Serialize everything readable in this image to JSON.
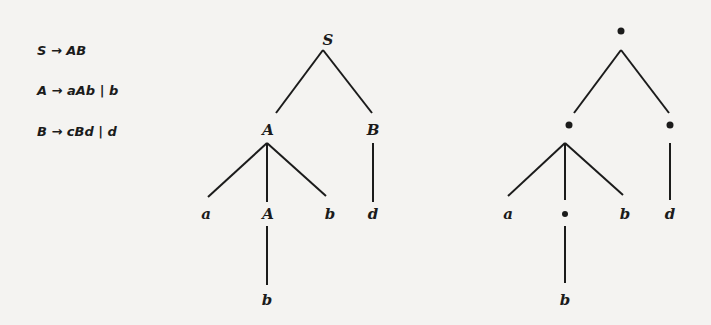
{
  "grammar": {
    "rules": [
      {
        "lhs": "S",
        "arrow": "→",
        "rhs": "AB",
        "text": "S → AB"
      },
      {
        "lhs": "A",
        "arrow": "→",
        "rhs": "aAb | b",
        "text": "A → aAb | b"
      },
      {
        "lhs": "B",
        "arrow": "→",
        "rhs": "cBd | d",
        "text": "B → cBd | d"
      }
    ]
  },
  "parse_tree": {
    "nodes": {
      "root": "S",
      "left_child": "A",
      "right_child": "B",
      "leaf_a": "a",
      "inner_A": "A",
      "leaf_b": "b",
      "leaf_d": "d",
      "inner_leaf_b": "b"
    }
  },
  "skeleton_tree": {
    "nodes": {
      "root": "•",
      "left_child": "•",
      "right_child": "•",
      "leaf_a": "a",
      "inner": "•",
      "leaf_b": "b",
      "leaf_d": "d",
      "inner_leaf_b": "b"
    }
  },
  "colors": {
    "ink": "#1b1b1b",
    "paper": "#f4f3f1"
  }
}
